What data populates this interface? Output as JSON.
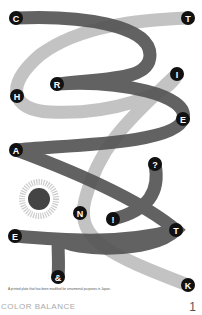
{
  "artwork": {
    "letters": [
      {
        "char": "C",
        "x": 16,
        "y": 18
      },
      {
        "char": "T",
        "x": 188,
        "y": 18
      },
      {
        "char": "R",
        "x": 57,
        "y": 84
      },
      {
        "char": "I",
        "x": 177,
        "y": 74
      },
      {
        "char": "H",
        "x": 17,
        "y": 96
      },
      {
        "char": "E",
        "x": 183,
        "y": 119
      },
      {
        "char": "A",
        "x": 16,
        "y": 150
      },
      {
        "char": "?",
        "x": 155,
        "y": 164
      },
      {
        "char": "N",
        "x": 80,
        "y": 213
      },
      {
        "char": "!",
        "x": 113,
        "y": 219
      },
      {
        "char": "T",
        "x": 176,
        "y": 230
      },
      {
        "char": "E",
        "x": 15,
        "y": 236
      },
      {
        "char": "&",
        "x": 58,
        "y": 277
      },
      {
        "char": "K",
        "x": 188,
        "y": 285
      }
    ],
    "colors": {
      "dark_ribbon": "#555555",
      "light_ribbon": "#bdbdbd",
      "node": "#111111",
      "sun": "#444444"
    }
  },
  "caption": "A printed plate that has been modified for ornamental purposes in Japan.",
  "footer": {
    "title": "COLOR BALANCE",
    "page_number": "1"
  }
}
